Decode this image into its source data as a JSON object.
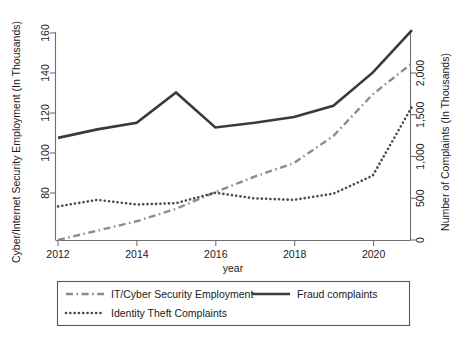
{
  "chart_data": {
    "type": "line",
    "title": "",
    "xlabel": "year",
    "ylabel": "Cyber/Internet Security Employment (In Thousands)",
    "y2label": "Number of Complaints (In Thousands)",
    "x": [
      2012,
      2013,
      2014,
      2015,
      2016,
      2017,
      2018,
      2019,
      2020,
      2021
    ],
    "xlim": [
      2012,
      2021
    ],
    "ylim": [
      70,
      170
    ],
    "y2lim": [
      0,
      2200
    ],
    "xticks": [
      2012,
      2014,
      2016,
      2018,
      2020
    ],
    "xticklabels": [
      "2012",
      "2014",
      "2016",
      "2018",
      "2020"
    ],
    "yticks": [
      80,
      100,
      120,
      140,
      160
    ],
    "yticklabels": [
      "80",
      "100",
      "120",
      "140",
      "160"
    ],
    "y2ticks": [
      0,
      500,
      1000,
      1500,
      2000
    ],
    "y2ticklabels": [
      "0",
      "500",
      "1,000",
      "1,500",
      "2,000"
    ],
    "grid": false,
    "legend_position": "below-plot",
    "series": [
      {
        "name": "IT/Cyber Security Employment",
        "axis": "left",
        "style": "dash-dot",
        "color": "#8c8c8c",
        "values": [
          70.0,
          74.5,
          79.0,
          85.0,
          93.0,
          100.5,
          107.0,
          120.0,
          140.0,
          155.0
        ]
      },
      {
        "name": "Fraud complaints",
        "axis": "right",
        "style": "solid",
        "color": "#3a3a3a",
        "values": [
          1080,
          1170,
          1240,
          1560,
          1190,
          1240,
          1300,
          1420,
          1770,
          2220
        ]
      },
      {
        "name": "Identity Theft Complaints",
        "axis": "right",
        "style": "dotted",
        "color": "#4a4a4a",
        "values": [
          355,
          425,
          375,
          390,
          500,
          440,
          425,
          490,
          680,
          1410
        ]
      }
    ]
  },
  "legend": {
    "entries": [
      {
        "label": "IT/Cyber Security Employment",
        "style": "dash-dot"
      },
      {
        "label": "Fraud complaints",
        "style": "solid"
      },
      {
        "label": "Identity Theft Complaints",
        "style": "dotted"
      }
    ]
  }
}
